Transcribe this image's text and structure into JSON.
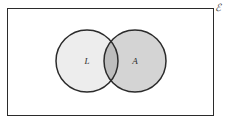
{
  "figure": {
    "type": "venn-diagram",
    "width": 226,
    "height": 126,
    "background_color": "#ffffff"
  },
  "universe": {
    "label": "ℰ",
    "label_name": "script-e-universal-set-symbol",
    "border_color": "#2b2b2b",
    "fill_color": "#ffffff",
    "x": 7,
    "y": 8,
    "width": 207,
    "height": 108
  },
  "sets": [
    {
      "id": "left",
      "label": "L",
      "fill_color": "#ededed",
      "stroke_color": "#2b2b2b",
      "cx": 87,
      "cy": 61,
      "r": 31
    },
    {
      "id": "right",
      "label": "A",
      "fill_color": "#d4d4d4",
      "stroke_color": "#2b2b2b",
      "cx": 135,
      "cy": 61,
      "r": 31
    }
  ],
  "intersection": {
    "fill_color": "#bdbdbd",
    "label": ""
  }
}
